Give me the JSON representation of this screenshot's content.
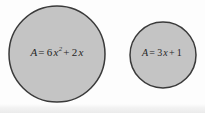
{
  "figure": {
    "background_color": "#fdfdfd",
    "shapes": [
      {
        "id": "circle-large",
        "name": "large-circle",
        "shape": "circle",
        "center_x": 57,
        "center_y": 54,
        "radius": 48,
        "fill_color": "#c4c4c4",
        "stroke_color": "#3a3a3a",
        "stroke_width": 1.5,
        "label": {
          "full_text": "A = 6x2 + 2x",
          "area_symbol": "A",
          "equals": "=",
          "coefficient_quadratic": "6",
          "variable": "x",
          "exponent": "2",
          "plus": "+",
          "coefficient_linear": "2",
          "linear_variable": "x"
        }
      },
      {
        "id": "circle-small",
        "name": "small-circle",
        "shape": "circle",
        "center_x": 163,
        "center_y": 55,
        "radius": 33,
        "fill_color": "#c4c4c4",
        "stroke_color": "#3a3a3a",
        "stroke_width": 1.5,
        "label": {
          "full_text": "A = 3x + 1",
          "area_symbol": "A",
          "equals": "=",
          "coefficient_linear": "3",
          "variable": "x",
          "plus": "+",
          "constant": "1"
        }
      }
    ]
  }
}
